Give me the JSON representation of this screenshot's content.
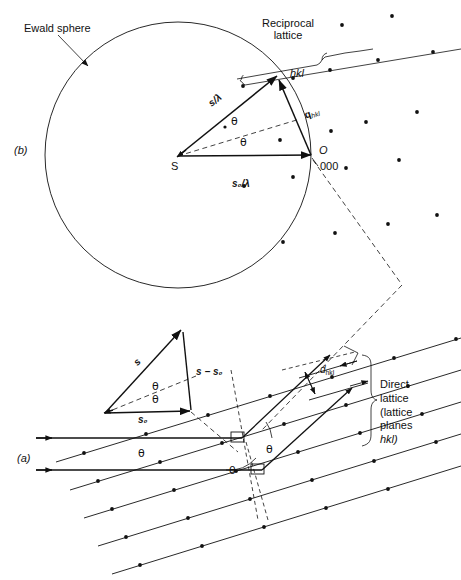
{
  "figure": {
    "title_panels": {
      "panel_b": "(b)",
      "panel_a": "(a)"
    }
  },
  "panel_b": {
    "panel_label": "(b)",
    "ewald_sphere_label": "Ewald sphere",
    "reciprocal_lattice_label_line1": "Reciprocal",
    "reciprocal_lattice_label_line2": "lattice",
    "node_hkl": "hkl",
    "node_origin": "O",
    "node_origin_index": "000",
    "source_point": "S",
    "vector_s_over_lambda": "s/λ",
    "vector_s0_over_lambda": "s₀/λ",
    "vector_q_hkl": "q",
    "vector_q_hkl_sub": "hkl",
    "angle_upper": "θ",
    "angle_lower": "θ"
  },
  "panel_a": {
    "panel_label": "(a)",
    "direct_lattice_line1": "Direct",
    "direct_lattice_line2": "lattice",
    "direct_lattice_line3": "(lattice",
    "direct_lattice_line4": "planes",
    "direct_lattice_line5": "hkl)",
    "d_spacing_label": "d",
    "d_spacing_sub": "hkl",
    "angle_incident_upper": "θ",
    "angle_scatter_right": "θ",
    "angle_incident_lower": "θ",
    "vector_triangle": {
      "vector_s": "s",
      "vector_s0": "s₀",
      "vector_diff": "s − s₀",
      "angle_upper": "θ",
      "angle_lower": "θ"
    }
  },
  "style": {
    "stroke": "#111111",
    "background": "#ffffff"
  }
}
